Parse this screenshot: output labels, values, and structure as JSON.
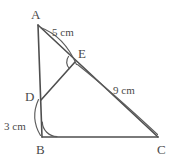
{
  "figure": {
    "type": "geometry-diagram",
    "canvas": {
      "width": 173,
      "height": 164,
      "background": "#ffffff"
    },
    "stroke_color": "#4f4f4f",
    "text_color": "#4a4a4a",
    "vertices": [
      {
        "id": "A",
        "label": "A",
        "x": 38,
        "y": 25,
        "label_x": 31,
        "label_y": 8
      },
      {
        "id": "B",
        "label": "B",
        "x": 42,
        "y": 137,
        "label_x": 36,
        "label_y": 143
      },
      {
        "id": "C",
        "label": "C",
        "x": 158,
        "y": 137,
        "label_x": 157,
        "label_y": 143
      },
      {
        "id": "D",
        "label": "D",
        "x": 41,
        "y": 100,
        "label_x": 25,
        "label_y": 90
      },
      {
        "id": "E",
        "label": "E",
        "x": 75,
        "y": 62,
        "label_x": 78,
        "label_y": 47
      }
    ],
    "segments": [
      {
        "id": "AB",
        "from": "A",
        "to": "B"
      },
      {
        "id": "BC",
        "from": "B",
        "to": "C"
      },
      {
        "id": "AC",
        "from": "A",
        "to": "C"
      },
      {
        "id": "DE",
        "from": "D",
        "to": "E"
      }
    ],
    "measurements": [
      {
        "id": "AE",
        "label": "5 cm",
        "between": "A-E",
        "label_x": 52,
        "label_y": 27
      },
      {
        "id": "EC",
        "label": "9 cm",
        "between": "E-C",
        "label_x": 113,
        "label_y": 85
      },
      {
        "id": "DB",
        "label": "3 cm",
        "between": "D-B",
        "label_x": 4,
        "label_y": 121
      }
    ],
    "angle_marks": [
      {
        "id": "angle-at-E",
        "vertex": "E"
      },
      {
        "id": "angle-at-B",
        "vertex": "B"
      }
    ]
  }
}
